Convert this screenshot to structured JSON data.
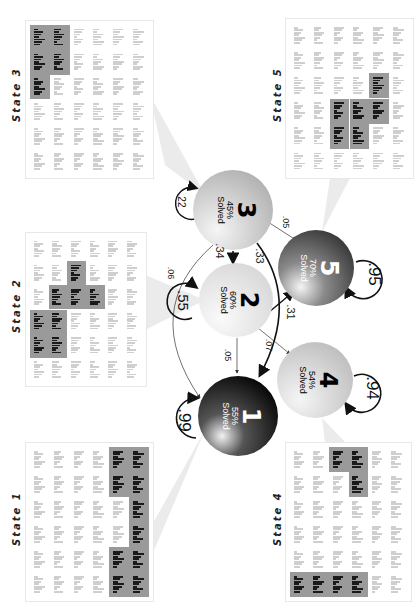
{
  "colors": {
    "highlight_panel": "#9a9a9a",
    "highlight_dark": "#7d7d7d",
    "cell_faint": "#cfcfcf",
    "bar_dark": "#1a1a1a",
    "wedge": "#ececec",
    "arrow": "#111111"
  },
  "states": [
    {
      "id": 3,
      "label": "State 3",
      "highlight": [
        [
          0,
          0
        ],
        [
          0,
          1
        ],
        [
          1,
          0
        ],
        [
          1,
          1
        ],
        [
          2,
          0
        ]
      ]
    },
    {
      "id": 5,
      "label": "State 5",
      "highlight": [
        [
          2,
          4
        ],
        [
          3,
          2
        ],
        [
          3,
          3
        ],
        [
          3,
          4
        ],
        [
          4,
          2
        ],
        [
          4,
          3
        ]
      ]
    },
    {
      "id": 2,
      "label": "State 2",
      "highlight": [
        [
          1,
          2
        ],
        [
          2,
          1
        ],
        [
          2,
          2
        ],
        [
          2,
          3
        ],
        [
          3,
          0
        ],
        [
          3,
          1
        ],
        [
          4,
          0
        ],
        [
          4,
          1
        ]
      ]
    },
    {
      "id": 1,
      "label": "State 1",
      "highlight": [
        [
          0,
          4
        ],
        [
          0,
          5
        ],
        [
          1,
          4
        ],
        [
          1,
          5
        ],
        [
          2,
          5
        ],
        [
          3,
          5
        ],
        [
          4,
          4
        ],
        [
          4,
          5
        ],
        [
          5,
          4
        ],
        [
          5,
          5
        ]
      ]
    },
    {
      "id": 4,
      "label": "State 4",
      "highlight": [
        [
          0,
          2
        ],
        [
          0,
          3
        ],
        [
          1,
          3
        ],
        [
          5,
          0
        ],
        [
          5,
          1
        ],
        [
          5,
          2
        ],
        [
          5,
          3
        ]
      ]
    }
  ],
  "nodes": [
    {
      "id": "1",
      "number": "1",
      "percent": "55%",
      "solved": "Solved",
      "self_loop": ".99"
    },
    {
      "id": "2",
      "number": "2",
      "percent": "60%",
      "solved": "Solved",
      "self_loop": ".55"
    },
    {
      "id": "3",
      "number": "3",
      "percent": "45%",
      "solved": "Solved",
      "self_loop": ".22"
    },
    {
      "id": "4",
      "number": "4",
      "percent": "54%",
      "solved": "Solved",
      "self_loop": ".94"
    },
    {
      "id": "5",
      "number": "5",
      "percent": "70%",
      "solved": "Solved",
      "self_loop": ".95"
    }
  ],
  "edges": [
    {
      "from": "3",
      "to": "2",
      "label": ".34"
    },
    {
      "from": "3",
      "to": "4",
      "label": ".33"
    },
    {
      "from": "3",
      "to": "5",
      "label": ".05"
    },
    {
      "from": "3",
      "to": "1",
      "label": ".06"
    },
    {
      "from": "2",
      "to": "5",
      "label": ".31"
    },
    {
      "from": "2",
      "to": "4",
      "label": ".07"
    },
    {
      "from": "2",
      "to": "1",
      "label": ".05"
    }
  ]
}
